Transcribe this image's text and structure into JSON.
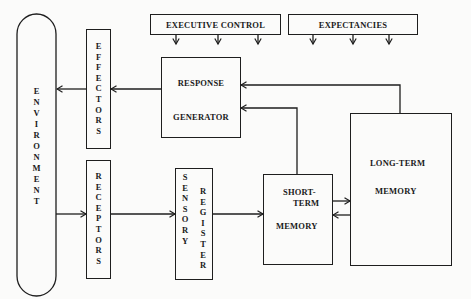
{
  "diagram": {
    "type": "information-processing-model",
    "nodes": {
      "executive_control": {
        "label": "EXECUTIVE CONTROL"
      },
      "expectancies": {
        "label": "EXPECTANCIES"
      },
      "response_generator": {
        "line1": "RESPONSE",
        "line2": "GENERATOR"
      },
      "effectors": {
        "label": "EFFECTORS",
        "letters": [
          "E",
          "F",
          "F",
          "E",
          "C",
          "T",
          "O",
          "R",
          "S"
        ]
      },
      "environment": {
        "label": "ENVIRONMENT",
        "letters": [
          "E",
          "N",
          "V",
          "I",
          "R",
          "O",
          "N",
          "M",
          "E",
          "N",
          "T"
        ]
      },
      "receptors": {
        "label": "RECEPTORS",
        "letters": [
          "R",
          "E",
          "C",
          "E",
          "P",
          "T",
          "O",
          "R",
          "S"
        ]
      },
      "sensory_register": {
        "label": "SENSORY REGISTER",
        "col1": [
          "S",
          "E",
          "N",
          "S",
          "O",
          "R",
          "Y"
        ],
        "col2": [
          "R",
          "E",
          "G",
          "I",
          "S",
          "T",
          "E",
          "R"
        ]
      },
      "short_term_memory": {
        "line1": "SHORT-",
        "line2": "TERM",
        "line3": "MEMORY"
      },
      "long_term_memory": {
        "line1": "LONG-TERM",
        "line2": "MEMORY"
      }
    },
    "edges": [
      {
        "from": "environment",
        "to": "receptors"
      },
      {
        "from": "receptors",
        "to": "sensory_register"
      },
      {
        "from": "sensory_register",
        "to": "short_term_memory"
      },
      {
        "from": "short_term_memory",
        "to": "long_term_memory"
      },
      {
        "from": "long_term_memory",
        "to": "short_term_memory"
      },
      {
        "from": "short_term_memory",
        "to": "response_generator"
      },
      {
        "from": "long_term_memory",
        "to": "response_generator"
      },
      {
        "from": "response_generator",
        "to": "effectors"
      },
      {
        "from": "effectors",
        "to": "environment"
      },
      {
        "from": "executive_control",
        "to": "process",
        "count": 3
      },
      {
        "from": "expectancies",
        "to": "process",
        "count": 3
      }
    ],
    "colors": {
      "line": "#1e1e1e",
      "background": "#fbfbfa"
    }
  }
}
